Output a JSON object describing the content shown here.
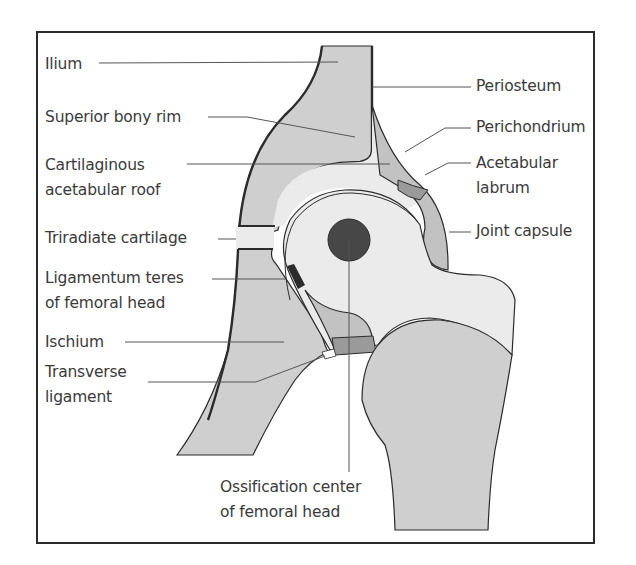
{
  "diagram": {
    "colors": {
      "frame": "#2b2b2b",
      "bone_gray": "#cfcfcf",
      "cartilage_light": "#ebebeb",
      "capsule_gray": "#c2c2c2",
      "labrum_dark": "#9a9a9a",
      "ossification_center": "#474747",
      "leader_line": "#555555",
      "text": "#3a3a3a"
    },
    "labels_left": [
      {
        "id": "ilium",
        "text": "Ilium"
      },
      {
        "id": "superior-bony-rim",
        "text": "Superior bony rim"
      },
      {
        "id": "cartilaginous-acetabular-roof",
        "line1": "Cartilaginous",
        "line2": "acetabular roof"
      },
      {
        "id": "triradiate-cartilage",
        "text": "Triradiate cartilage"
      },
      {
        "id": "ligamentum-teres",
        "line1": "Ligamentum teres",
        "line2": "of femoral head"
      },
      {
        "id": "ischium",
        "text": "Ischium"
      },
      {
        "id": "transverse-ligament",
        "line1": "Transverse",
        "line2": "ligament"
      }
    ],
    "labels_right": [
      {
        "id": "periosteum",
        "text": "Periosteum"
      },
      {
        "id": "perichondrium",
        "text": "Perichondrium"
      },
      {
        "id": "acetabular-labrum",
        "line1": "Acetabular",
        "line2": "labrum"
      },
      {
        "id": "joint-capsule",
        "text": "Joint capsule"
      }
    ],
    "labels_bottom": [
      {
        "id": "ossification-center",
        "line1": "Ossification center",
        "line2": "of femoral head"
      }
    ]
  }
}
